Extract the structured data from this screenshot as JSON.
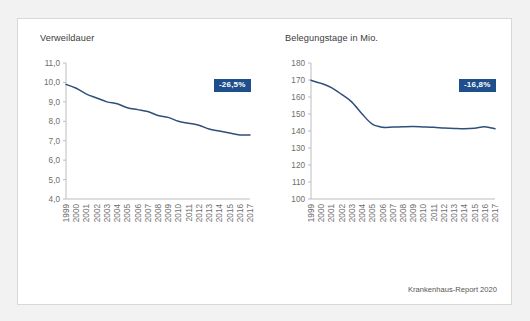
{
  "figure": {
    "source_note": "Krankenhaus-Report 2020"
  },
  "chart_data": [
    {
      "type": "line",
      "title": "Verweildauer",
      "panel": "left",
      "xlabel": "",
      "ylabel": "",
      "x": [
        1999,
        2000,
        2001,
        2002,
        2003,
        2004,
        2005,
        2006,
        2007,
        2008,
        2009,
        2010,
        2011,
        2012,
        2013,
        2014,
        2015,
        2016,
        2017
      ],
      "values": [
        9.9,
        9.7,
        9.4,
        9.2,
        9.0,
        8.9,
        8.7,
        8.6,
        8.5,
        8.3,
        8.2,
        8.0,
        7.9,
        7.8,
        7.6,
        7.5,
        7.4,
        7.3,
        7.3
      ],
      "categories": [
        "1999",
        "2000",
        "2001",
        "2002",
        "2003",
        "2004",
        "2005",
        "2006",
        "2007",
        "2008",
        "2009",
        "2010",
        "2011",
        "2012",
        "2013",
        "2014",
        "2015",
        "2016",
        "2017"
      ],
      "ylim": [
        4.0,
        11.0
      ],
      "ytick_labels": [
        "11,0",
        "10,0",
        "9,0",
        "8,0",
        "7,0",
        "6,0",
        "5,0",
        "4,0"
      ],
      "ytick_values": [
        11.0,
        10.0,
        9.0,
        8.0,
        7.0,
        6.0,
        5.0,
        4.0
      ],
      "grid": false,
      "legend": "none",
      "annotation": "-26,5%",
      "series_color": "#2e4f7b"
    },
    {
      "type": "line",
      "title": "Belegungstage in Mio.",
      "panel": "right",
      "xlabel": "",
      "ylabel": "",
      "x": [
        1999,
        2000,
        2001,
        2002,
        2003,
        2004,
        2005,
        2006,
        2007,
        2008,
        2009,
        2010,
        2011,
        2012,
        2013,
        2014,
        2015,
        2016,
        2017
      ],
      "values": [
        169.8,
        168.0,
        165.5,
        161.5,
        157.0,
        150.0,
        144.0,
        142.2,
        142.3,
        142.5,
        142.6,
        142.4,
        142.2,
        141.8,
        141.5,
        141.3,
        141.6,
        142.5,
        141.3
      ],
      "categories": [
        "1999",
        "2000",
        "2001",
        "2002",
        "2003",
        "2004",
        "2005",
        "2006",
        "2007",
        "2008",
        "2009",
        "2010",
        "2011",
        "2012",
        "2013",
        "2014",
        "2015",
        "2016",
        "2017"
      ],
      "ylim": [
        100,
        180
      ],
      "ytick_labels": [
        "180",
        "170",
        "160",
        "150",
        "140",
        "130",
        "120",
        "110",
        "100"
      ],
      "ytick_values": [
        180,
        170,
        160,
        150,
        140,
        130,
        120,
        110,
        100
      ],
      "grid": false,
      "legend": "none",
      "annotation": "-16,8%",
      "series_color": "#2e4f7b"
    }
  ]
}
